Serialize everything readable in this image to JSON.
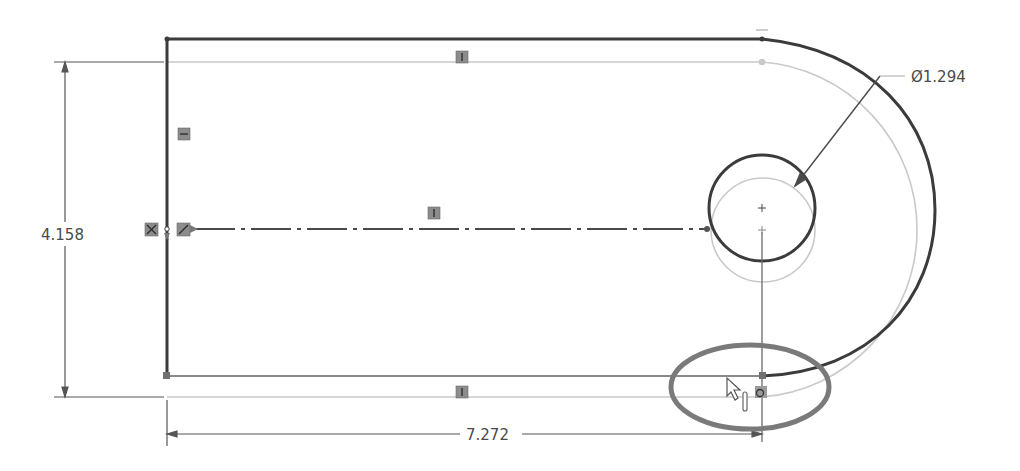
{
  "sketch": {
    "dimensions": {
      "height": {
        "label": "4.158"
      },
      "width": {
        "label": "7.272"
      },
      "diameter": {
        "symbol": "Ø",
        "label": "1.294",
        "full_label": "Ø1.294"
      }
    },
    "relations": [
      {
        "name": "horizontal-top",
        "glyph": "horizontal"
      },
      {
        "name": "vertical-left",
        "glyph": "vertical"
      },
      {
        "name": "horizontal-centerline",
        "glyph": "horizontal"
      },
      {
        "name": "horizontal-bottom",
        "glyph": "horizontal"
      },
      {
        "name": "coincident-left",
        "glyph": "coincident"
      },
      {
        "name": "midpoint-left",
        "glyph": "midpoint"
      },
      {
        "name": "coincident-bottom-right",
        "glyph": "coincident"
      }
    ],
    "highlight": {
      "shape": "ellipse",
      "color": "#7a7a7a"
    },
    "colors": {
      "geometry": "#3a3a3a",
      "preview": "#c8c8c8",
      "dimension": "#5a5a5a"
    }
  }
}
